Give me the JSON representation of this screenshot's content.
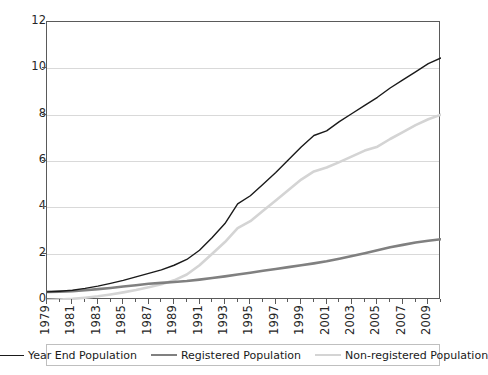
{
  "chart_data": {
    "type": "line",
    "title": "",
    "subtitle": "",
    "xlabel": "",
    "ylabel": "",
    "grid": true,
    "legend_position": "bottom",
    "xlim": [
      1979,
      2010
    ],
    "ylim": [
      0,
      12
    ],
    "yticks": [
      0,
      2,
      4,
      6,
      8,
      10,
      12
    ],
    "ytick_labels": [
      "0",
      "2",
      "4",
      "6",
      "8",
      "10",
      "12"
    ],
    "x": [
      1979,
      1980,
      1981,
      1982,
      1983,
      1984,
      1985,
      1986,
      1987,
      1988,
      1989,
      1990,
      1991,
      1992,
      1993,
      1994,
      1995,
      1996,
      1997,
      1998,
      1999,
      2000,
      2001,
      2002,
      2003,
      2004,
      2005,
      2006,
      2007,
      2008,
      2009,
      2010
    ],
    "xtick_labels": [
      "1979",
      "1981",
      "1983",
      "1985",
      "1987",
      "1989",
      "1991",
      "1993",
      "1995",
      "1997",
      "1999",
      "2001",
      "2003",
      "2005",
      "2007",
      "2009"
    ],
    "xtick_values": [
      1979,
      1981,
      1983,
      1985,
      1987,
      1989,
      1991,
      1993,
      1995,
      1997,
      1999,
      2001,
      2003,
      2005,
      2007,
      2009
    ],
    "series": [
      {
        "name": "Year End Population",
        "color": "#1a1a1a",
        "width": 1.4,
        "values": [
          0.35,
          0.38,
          0.42,
          0.5,
          0.6,
          0.72,
          0.85,
          1.0,
          1.15,
          1.3,
          1.5,
          1.75,
          2.15,
          2.7,
          3.3,
          4.15,
          4.5,
          5.0,
          5.5,
          6.05,
          6.6,
          7.1,
          7.3,
          7.7,
          8.05,
          8.4,
          8.75,
          9.15,
          9.5,
          9.85,
          10.2,
          10.45
        ]
      },
      {
        "name": "Registered Population",
        "color": "#808080",
        "width": 2.6,
        "values": [
          0.35,
          0.36,
          0.38,
          0.42,
          0.47,
          0.52,
          0.58,
          0.64,
          0.7,
          0.74,
          0.78,
          0.82,
          0.88,
          0.95,
          1.02,
          1.1,
          1.18,
          1.26,
          1.34,
          1.42,
          1.5,
          1.58,
          1.67,
          1.78,
          1.9,
          2.02,
          2.15,
          2.28,
          2.38,
          2.48,
          2.56,
          2.62
        ]
      },
      {
        "name": "Non-registered Population",
        "color": "#d4d4d4",
        "width": 2.6,
        "values": [
          0.0,
          0.02,
          0.05,
          0.1,
          0.16,
          0.24,
          0.33,
          0.43,
          0.55,
          0.68,
          0.85,
          1.1,
          1.5,
          2.0,
          2.5,
          3.1,
          3.4,
          3.85,
          4.3,
          4.75,
          5.2,
          5.55,
          5.72,
          5.95,
          6.2,
          6.45,
          6.62,
          6.95,
          7.25,
          7.55,
          7.8,
          8.0
        ]
      }
    ],
    "legend": [
      {
        "label": "Year End Population",
        "color": "#1a1a1a",
        "width": 1.4
      },
      {
        "label": "Registered Population",
        "color": "#808080",
        "width": 2.6
      },
      {
        "label": "Non-registered Population",
        "color": "#d4d4d4",
        "width": 2.6
      }
    ],
    "colors": {
      "axis": "#5a5a5a",
      "grid": "#d9d9d9",
      "background": "#ffffff",
      "text": "#262626",
      "legend_border": "#bfbfbf"
    }
  }
}
